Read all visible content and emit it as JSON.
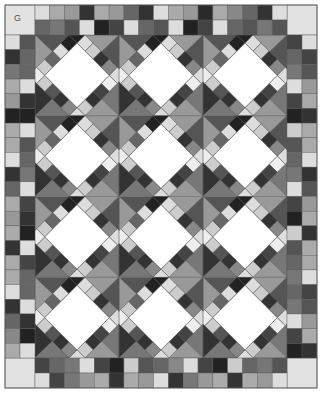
{
  "diagram": {
    "label": "G",
    "quilt": {
      "x": 5,
      "y": 5,
      "width": 312,
      "height": 383,
      "border_width": 30,
      "cell_w": 14.88,
      "cell_h": 14.73,
      "blocks_cols": 3,
      "blocks_rows": 4,
      "corner_color": "#e2e2e2",
      "outline_color": "#555555",
      "top_border": [
        [
          "#dcdcdc",
          "#aaaaaa",
          "#999999",
          "#333333",
          "#aaaaaa",
          "#999999",
          "#666666",
          "#333333",
          "#dddddd",
          "#aaaaaa",
          "#999999",
          "#2a2a2a",
          "#aaaaaa",
          "#888888",
          "#666666",
          "#333333",
          "#dddddd"
        ],
        [
          "#666666",
          "#777777",
          "#555555",
          "#dddddd",
          "#222222",
          "#444444",
          "#dddddd",
          "#666666",
          "#555555",
          "#dddddd",
          "#222222",
          "#444444",
          "#dddddd",
          "#666666",
          "#555555",
          "#777777",
          "#555555"
        ]
      ],
      "bottom_border": [
        [
          "#444444",
          "#666666",
          "#777777",
          "#dddddd",
          "#444444",
          "#222222",
          "#cccccc",
          "#555555",
          "#666666",
          "#888888",
          "#dddddd",
          "#444444",
          "#222222",
          "#cccccc",
          "#666666",
          "#777777",
          "#555555"
        ],
        [
          "#dddddd",
          "#444444",
          "#777777",
          "#999999",
          "#aaaaaa",
          "#333333",
          "#aaaaaa",
          "#999999",
          "#dddddd",
          "#333333",
          "#777777",
          "#999999",
          "#aaaaaa",
          "#333333",
          "#aaaaaa",
          "#999999",
          "#dddddd"
        ]
      ],
      "left_border": [
        [
          "#dddddd",
          "#333333",
          "#777777",
          "#aaaaaa",
          "#999999",
          "#222222",
          "#aaaaaa",
          "#aaaaaa",
          "#dddddd",
          "#333333",
          "#666666",
          "#aaaaaa",
          "#999999",
          "#aaaaaa",
          "#333333",
          "#aaaaaa",
          "#aaaaaa",
          "#dddddd",
          "#333333",
          "#666666",
          "#888888",
          "#aaaaaa"
        ],
        [
          "#555555",
          "#666666",
          "#666666",
          "#dddddd",
          "#333333",
          "#222222",
          "#dddddd",
          "#555555",
          "#666666",
          "#777777",
          "#dddddd",
          "#444444",
          "#333333",
          "#222222",
          "#dddddd",
          "#444444",
          "#666666",
          "#666666",
          "#dddddd",
          "#333333",
          "#222222",
          "#dddddd"
        ]
      ],
      "right_border": [
        [
          "#444444",
          "#666666",
          "#777777",
          "#dddddd",
          "#444444",
          "#222222",
          "#cccccc",
          "#555555",
          "#666666",
          "#777777",
          "#dddddd",
          "#444444",
          "#222222",
          "#cccccc",
          "#555555",
          "#666666",
          "#777777",
          "#666666",
          "#777777",
          "#dddddd",
          "#444444",
          "#222222"
        ],
        [
          "#dddddd",
          "#444444",
          "#555555",
          "#999999",
          "#aaaaaa",
          "#333333",
          "#aaaaaa",
          "#aaaaaa",
          "#dddddd",
          "#333333",
          "#555555",
          "#999999",
          "#aaaaaa",
          "#333333",
          "#aaaaaa",
          "#aaaaaa",
          "#dddddd",
          "#444444",
          "#555555",
          "#999999",
          "#aaaaaa",
          "#333333"
        ]
      ],
      "block": {
        "center_color": "#ffffff",
        "corner_triangles": {
          "top_left": [
            "#555555",
            "#999999"
          ],
          "top_right": [
            "#999999",
            "#555555"
          ],
          "bottom_left": [
            "#333333",
            "#777777"
          ],
          "bottom_right": [
            "#777777",
            "#999999"
          ]
        },
        "ring_grid": 6,
        "ring_colors": [
          "#222222",
          "#dddddd",
          "#cccccc",
          "#333333",
          "#888888",
          "#dddddd",
          "#eeeeee",
          "#444444",
          "#333333",
          "#cccccc",
          "#dddddd",
          "#888888",
          "#333333",
          "#555555",
          "#cccccc",
          "#eeeeee",
          "#cccccc",
          "#666666",
          "#dddddd",
          "#222222"
        ]
      }
    }
  }
}
